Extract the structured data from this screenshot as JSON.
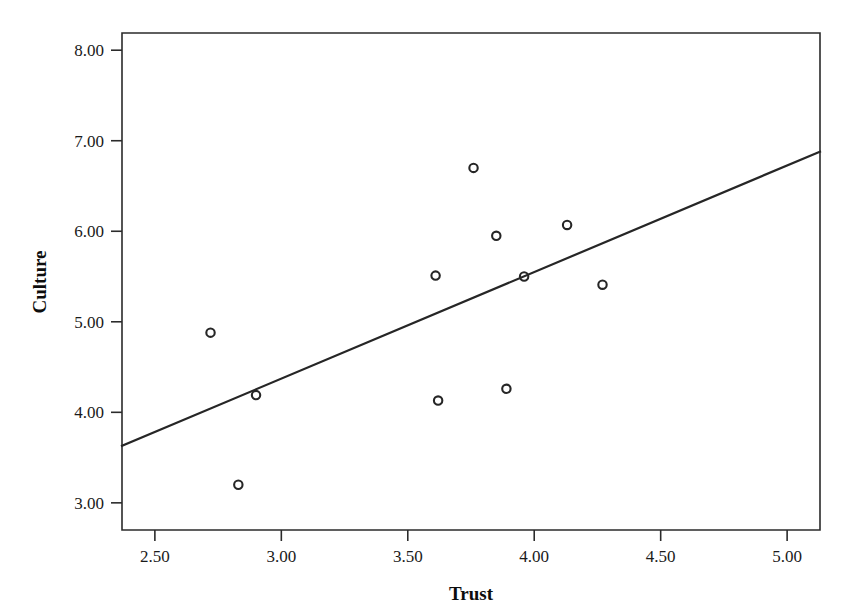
{
  "chart_data": {
    "type": "scatter",
    "title": "",
    "subtitle": "",
    "xlabel": "Trust",
    "ylabel": "Culture",
    "xlim": [
      2.37,
      5.13
    ],
    "ylim": [
      2.7,
      8.19
    ],
    "xticks": [
      2.5,
      3.0,
      3.5,
      4.0,
      4.5,
      5.0
    ],
    "xticklabels": [
      "2.50",
      "3.00",
      "3.50",
      "4.00",
      "4.50",
      "5.00"
    ],
    "yticks": [
      3.0,
      4.0,
      5.0,
      6.0,
      7.0,
      8.0
    ],
    "yticklabels": [
      "3.00",
      "4.00",
      "5.00",
      "6.00",
      "7.00",
      "8.00"
    ],
    "grid": false,
    "legend": false,
    "legend_position": "none",
    "marker": "open-circle",
    "marker_color": "#262626",
    "series": [
      {
        "name": "observations",
        "x": [
          2.72,
          2.83,
          2.9,
          3.61,
          3.62,
          3.76,
          3.85,
          3.89,
          3.96,
          4.13,
          4.27
        ],
        "y": [
          4.88,
          3.2,
          4.19,
          5.51,
          4.13,
          6.7,
          5.95,
          4.26,
          5.5,
          6.07,
          5.41
        ]
      }
    ],
    "points": [
      {
        "x": 2.72,
        "y": 4.88
      },
      {
        "x": 2.83,
        "y": 3.2
      },
      {
        "x": 2.9,
        "y": 4.19
      },
      {
        "x": 3.61,
        "y": 5.51
      },
      {
        "x": 3.62,
        "y": 4.13
      },
      {
        "x": 3.76,
        "y": 6.7
      },
      {
        "x": 3.85,
        "y": 5.95
      },
      {
        "x": 3.89,
        "y": 4.26
      },
      {
        "x": 3.96,
        "y": 5.5
      },
      {
        "x": 4.13,
        "y": 6.07
      },
      {
        "x": 4.27,
        "y": 5.41
      }
    ],
    "fit_line": {
      "name": "linear-fit",
      "x_start": 2.37,
      "y_start": 3.63,
      "x_end": 5.13,
      "y_end": 6.88,
      "slope": 1.177,
      "intercept": 0.843,
      "color": "#262626"
    },
    "plot_box": {
      "left_px": 122,
      "right_px": 820,
      "top_px": 33,
      "bottom_px": 530
    }
  },
  "axes": {
    "x_title": "Trust",
    "y_title": "Culture"
  }
}
